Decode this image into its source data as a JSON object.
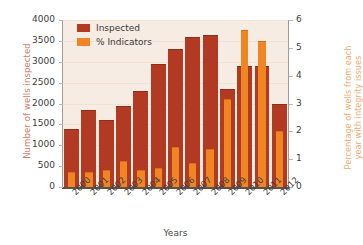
{
  "chart_data": {
    "type": "bar",
    "title": "",
    "xlabel": "Years",
    "ylabel": "Number of wells inspected",
    "ylabel_right_line1": "Percentage of wells from each",
    "ylabel_right_line2": "year with integrity issues",
    "categories": [
      "2000",
      "2001",
      "2002",
      "2003",
      "2004",
      "2005",
      "2006",
      "2007",
      "2008",
      "2009",
      "2010",
      "2011",
      "2012"
    ],
    "ylim": [
      0,
      4000
    ],
    "yticks": [
      0,
      500,
      1000,
      1500,
      2000,
      2500,
      3000,
      3500,
      4000
    ],
    "ylim_right": [
      0,
      6
    ],
    "yticks_right": [
      0,
      1,
      2,
      3,
      4,
      5,
      6
    ],
    "grid": true,
    "legend_position": "top-left",
    "series": [
      {
        "name": "Inspected",
        "axis": "left",
        "color": "#b33a22",
        "values": [
          1400,
          1850,
          1600,
          1950,
          2300,
          2950,
          3300,
          3600,
          3650,
          2350,
          2900,
          2900,
          2000
        ]
      },
      {
        "name": "% Indicators",
        "axis": "right",
        "color": "#f08623",
        "values": [
          0.55,
          0.55,
          0.6,
          0.95,
          0.6,
          0.7,
          1.45,
          0.85,
          1.35,
          3.15,
          5.65,
          5.25,
          2.0
        ]
      }
    ]
  },
  "axes": {
    "left_title": "Number of wells inspected",
    "right_title_line1": "Percentage of wells from each",
    "right_title_line2": "year with integrity issues",
    "bottom_title": "Years"
  },
  "legend": {
    "items": [
      {
        "label": "Inspected",
        "color": "#b33a22"
      },
      {
        "label": "% Indicators",
        "color": "#f08623"
      }
    ]
  },
  "colors": {
    "inspected": "#b33a22",
    "indicators": "#f08623",
    "plot_background": "#f7ece4",
    "left_axis_text": "#cf7a6a",
    "right_axis_text": "#efa96a"
  }
}
